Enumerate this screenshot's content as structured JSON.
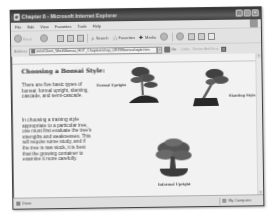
{
  "window": {
    "title": "Chapter 8 - Microsoft Internet Explorer",
    "app_icon": "ie-icon",
    "controls": {
      "minimize": "_",
      "maximize": "□",
      "close": "×"
    }
  },
  "menubar": {
    "items": [
      {
        "label": "File"
      },
      {
        "label": "Edit"
      },
      {
        "label": "View"
      },
      {
        "label": "Favorites"
      },
      {
        "label": "Tools"
      },
      {
        "label": "Help"
      }
    ]
  },
  "toolbar": {
    "back_label": "Back",
    "search_label": "Search",
    "favorites_label": "Favorites",
    "media_label": "Media"
  },
  "addressbar": {
    "label": "Address",
    "url": "ents\\Client_Work\\Bonsai_HOT_Chapters\\chap_08\\TM\\bonsai\\style.htm",
    "go_label": "Go",
    "links_label": "Links",
    "norton_label": "Norton AntiVirus"
  },
  "page": {
    "heading": "Choosing a Bonsai Style:",
    "paragraphs": [
      "There are five basic types of bonsai: formal upright, slanting, cascade, and semi-cascade.",
      "In choosing a training style appropriate to a particular tree, one must first evaluate the tree's strengths and weaknesses. This will require some study, and if the tree is raw stock, it is best that the growing container to examine it more carefully."
    ],
    "images": [
      {
        "label": "Formal Upright",
        "icon": "bonsai-formal-upright-image"
      },
      {
        "label": "Slanting Style",
        "icon": "bonsai-slanting-image"
      },
      {
        "label": "Informal Upright",
        "icon": "bonsai-informal-upright-image"
      }
    ]
  },
  "statusbar": {
    "left_text": "Done",
    "right_text": "My Computer"
  }
}
